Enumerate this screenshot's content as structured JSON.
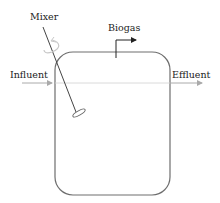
{
  "diagram": {
    "type": "reactor-schematic",
    "labels": {
      "mixer": "Mixer",
      "biogas": "Biogas",
      "influent": "Influent",
      "effluent": "Effluent"
    },
    "colors": {
      "outline": "#6e6e6e",
      "flow_line": "#b4b4b4",
      "text": "#222222",
      "rotation_arrow": "#c8c8c8"
    }
  }
}
